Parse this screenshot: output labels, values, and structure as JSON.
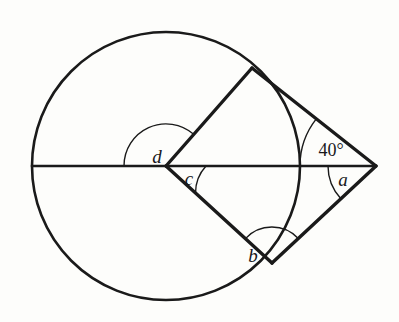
{
  "figure": {
    "background_color": "#fdfdfb",
    "stroke_color": "#1a1a1a",
    "circle": {
      "center_x": 166,
      "center_y": 166,
      "radius": 134,
      "stroke_width": 2.6
    },
    "points": {
      "center": {
        "x": 166,
        "y": 166
      },
      "apex": {
        "x": 376,
        "y": 166
      },
      "upper_tangent": {
        "x": 252,
        "y": 68
      },
      "lower_tangent": {
        "x": 272,
        "y": 263
      },
      "left_circle_edge": {
        "x": 32,
        "y": 166
      },
      "right_circle_edge": {
        "x": 300,
        "y": 166
      }
    },
    "segments": [
      {
        "name": "diameter-chord-line",
        "x1": 32,
        "y1": 166,
        "x2": 376,
        "y2": 166,
        "stroke_width": 2.6
      },
      {
        "name": "radius-to-upper-tangent",
        "x1": 166,
        "y1": 166,
        "x2": 252,
        "y2": 68,
        "stroke_width": 3.4
      },
      {
        "name": "radius-to-lower-tangent",
        "x1": 166,
        "y1": 166,
        "x2": 272,
        "y2": 263,
        "stroke_width": 3.4
      },
      {
        "name": "upper-tangent-line",
        "x1": 252,
        "y1": 68,
        "x2": 376,
        "y2": 166,
        "stroke_width": 3.4
      },
      {
        "name": "lower-tangent-line",
        "x1": 272,
        "y1": 263,
        "x2": 376,
        "y2": 166,
        "stroke_width": 3.4
      }
    ],
    "angle_arcs": [
      {
        "name": "arc-angle-d",
        "cx": 166,
        "cy": 166,
        "r": 42,
        "start_deg": 180,
        "end_deg": 311.3
      },
      {
        "name": "arc-angle-c",
        "cx": 166,
        "cy": 166,
        "r": 40,
        "start_deg": 0,
        "end_deg": 42.5
      },
      {
        "name": "arc-angle-b",
        "cx": 272,
        "cy": 263,
        "r": 36,
        "start_deg": 222.5,
        "end_deg": 317
      },
      {
        "name": "arc-angle-a",
        "cx": 376,
        "cy": 166,
        "r": 48,
        "start_deg": 180,
        "end_deg": 223
      },
      {
        "name": "arc-angle-40",
        "cx": 376,
        "cy": 166,
        "r": 76,
        "start_deg": 141.7,
        "end_deg": 180
      }
    ],
    "labels": [
      {
        "name": "angle-label-d",
        "text": "d",
        "x": 157,
        "y": 156,
        "style": "italic"
      },
      {
        "name": "angle-label-c",
        "text": "c",
        "x": 189,
        "y": 178,
        "style": "italic"
      },
      {
        "name": "angle-label-b",
        "text": "b",
        "x": 253,
        "y": 255,
        "style": "italic"
      },
      {
        "name": "angle-label-a",
        "text": "a",
        "x": 343,
        "y": 179,
        "style": "italic"
      },
      {
        "name": "angle-measure-40",
        "text": "40°",
        "x": 331,
        "y": 150,
        "style": "upright"
      }
    ],
    "angles": {
      "a": "a",
      "b": "b",
      "c": "c",
      "d": "d",
      "known_measure": "40°"
    }
  }
}
